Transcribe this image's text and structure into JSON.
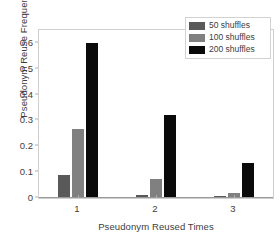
{
  "chart_data": {
    "type": "bar",
    "title": "",
    "xlabel": "Pseudonym Reused Times",
    "ylabel": "Pseudonym Reuse Frequency",
    "categories": [
      "1",
      "2",
      "3"
    ],
    "series": [
      {
        "name": "50 shuffles",
        "color": "#595959",
        "values": [
          0.086,
          0.008,
          0.003
        ]
      },
      {
        "name": "100 shuffles",
        "color": "#808080",
        "values": [
          0.264,
          0.071,
          0.014
        ]
      },
      {
        "name": "200 shuffles",
        "color": "#0a0a0a",
        "values": [
          0.596,
          0.318,
          0.132
        ]
      }
    ],
    "ylim": [
      0,
      0.65
    ],
    "yticks": [
      "0",
      "0.1",
      "0.2",
      "0.3",
      "0.4",
      "0.5",
      "0.6"
    ],
    "ytick_values": [
      0,
      0.1,
      0.2,
      0.3,
      0.4,
      0.5,
      0.6
    ],
    "xlim": [
      0.5,
      3.5
    ],
    "grid": false,
    "legend_position": "top-right",
    "legend_entries": [
      "50 shuffles",
      "100 shuffles",
      "200 shuffles"
    ],
    "axis_color": "#cfcfcf",
    "text_color": "#3d3d3d"
  }
}
